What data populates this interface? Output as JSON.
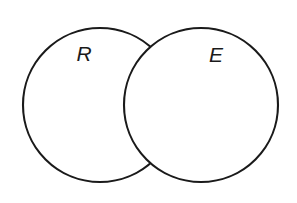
{
  "diagram": {
    "type": "venn-two-set",
    "title": "",
    "background_color": "#ffffff",
    "stroke_color": "#1a1a1a",
    "fill_color": "#ffffff",
    "stroke_width": 2.1,
    "canvas": {
      "width": 297,
      "height": 203
    },
    "sets": [
      {
        "id": "set-r",
        "label": "R",
        "center_x": 100,
        "center_y": 105,
        "radius": 77,
        "label_x": 84,
        "label_y": 61
      },
      {
        "id": "set-e",
        "label": "E",
        "center_x": 201,
        "center_y": 105,
        "radius": 77,
        "label_x": 216,
        "label_y": 62
      }
    ],
    "intersection": {
      "label": "",
      "top_point_x": 151,
      "top_point_y": 37,
      "bottom_point_x": 151,
      "bottom_point_y": 172
    }
  }
}
